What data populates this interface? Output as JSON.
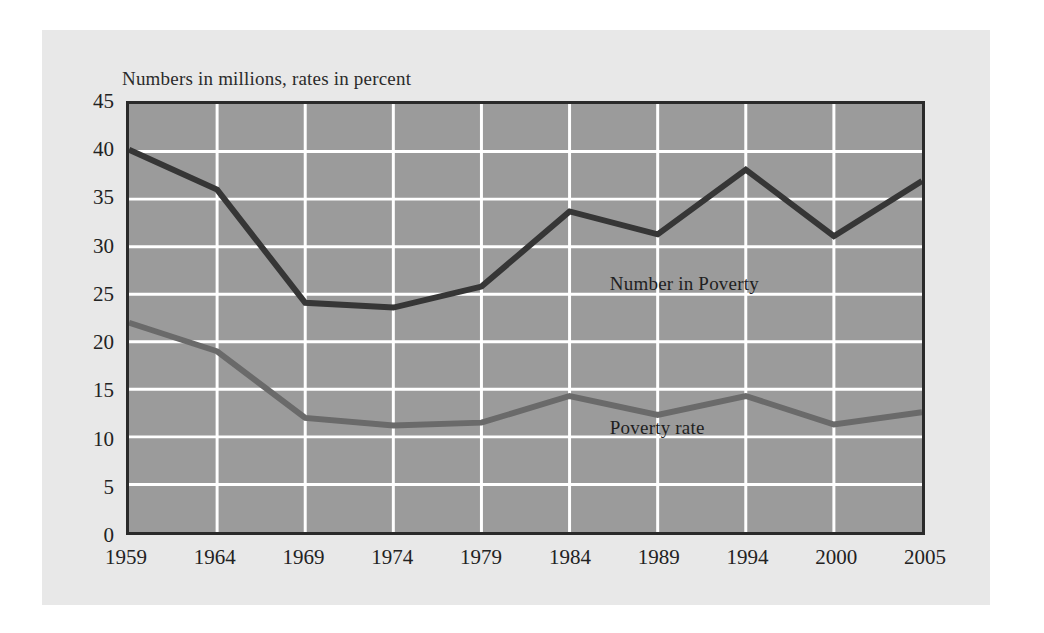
{
  "figure": {
    "title": "Numbers in millions, rates in percent",
    "background_color": "#e8e8e8",
    "page_color": "#ffffff",
    "plot_background_color": "#9b9b9b",
    "gridline_color": "#ffffff",
    "axis_border_color": "#2a2a2a"
  },
  "annotations": {
    "number_in_poverty_label": "Number in Poverty",
    "poverty_rate_label": "Poverty rate"
  },
  "chart_data": {
    "type": "line",
    "title": "Numbers in millions, rates in percent",
    "xlabel": "",
    "ylabel": "",
    "categories": [
      "1959",
      "1964",
      "1969",
      "1974",
      "1979",
      "1984",
      "1989",
      "1994",
      "2000",
      "2005"
    ],
    "x": [
      1959,
      1964,
      1969,
      1974,
      1979,
      1984,
      1989,
      1994,
      2000,
      2005
    ],
    "ylim": [
      0,
      45
    ],
    "yticks": [
      0,
      5,
      10,
      15,
      20,
      25,
      30,
      35,
      40,
      45
    ],
    "ytick_labels": [
      "0",
      "5",
      "10",
      "15",
      "20",
      "25",
      "30",
      "35",
      "40",
      "45"
    ],
    "grid": true,
    "legend": "inline annotations",
    "series": [
      {
        "name": "Number in Poverty",
        "units": "millions",
        "color": "#363636",
        "line_width": 6,
        "values": [
          40.2,
          36.0,
          24.1,
          23.6,
          25.8,
          33.7,
          31.3,
          38.1,
          31.1,
          36.9
        ]
      },
      {
        "name": "Poverty rate",
        "units": "percent",
        "color": "#6a6a6a",
        "line_width": 6,
        "values": [
          22.0,
          19.0,
          12.0,
          11.2,
          11.5,
          14.3,
          12.3,
          14.3,
          11.3,
          12.6
        ]
      }
    ]
  }
}
